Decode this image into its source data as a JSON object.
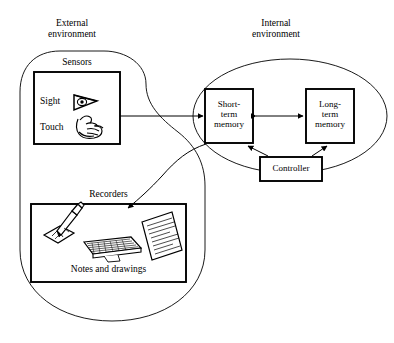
{
  "diagram": {
    "title_external": "External\nenvironment",
    "title_internal": "Internal\nenvironment",
    "external": {
      "sensors_label": "Sensors",
      "sensors": [
        {
          "label": "Sight",
          "icon": "eye-icon"
        },
        {
          "label": "Touch",
          "icon": "hand-icon"
        }
      ],
      "recorders_label": "Recorders",
      "recorders_caption": "Notes and drawings",
      "recorder_icons": [
        "pencil-drawing-icon",
        "keyboard-icon",
        "notes-page-icon"
      ]
    },
    "internal": {
      "boxes": [
        {
          "id": "short-term-memory",
          "label": "Short-\nterm\nmemory"
        },
        {
          "id": "long-term-memory",
          "label": "Long-\nterm\nmemory"
        },
        {
          "id": "controller",
          "label": "Controller"
        }
      ]
    },
    "arrows": [
      {
        "id": "sensors-to-short-term-memory",
        "kind": "straight",
        "heads": "end"
      },
      {
        "id": "short-term-to-long-term-memory",
        "kind": "straight",
        "heads": "both"
      },
      {
        "id": "controller-to-short-term-memory",
        "kind": "straight",
        "heads": "end"
      },
      {
        "id": "controller-to-long-term-memory",
        "kind": "straight",
        "heads": "end"
      },
      {
        "id": "short-term-memory-to-recorders",
        "kind": "curved",
        "heads": "end"
      }
    ],
    "colors": {
      "stroke": "#000000",
      "background": "#ffffff",
      "text": "#000000"
    }
  }
}
